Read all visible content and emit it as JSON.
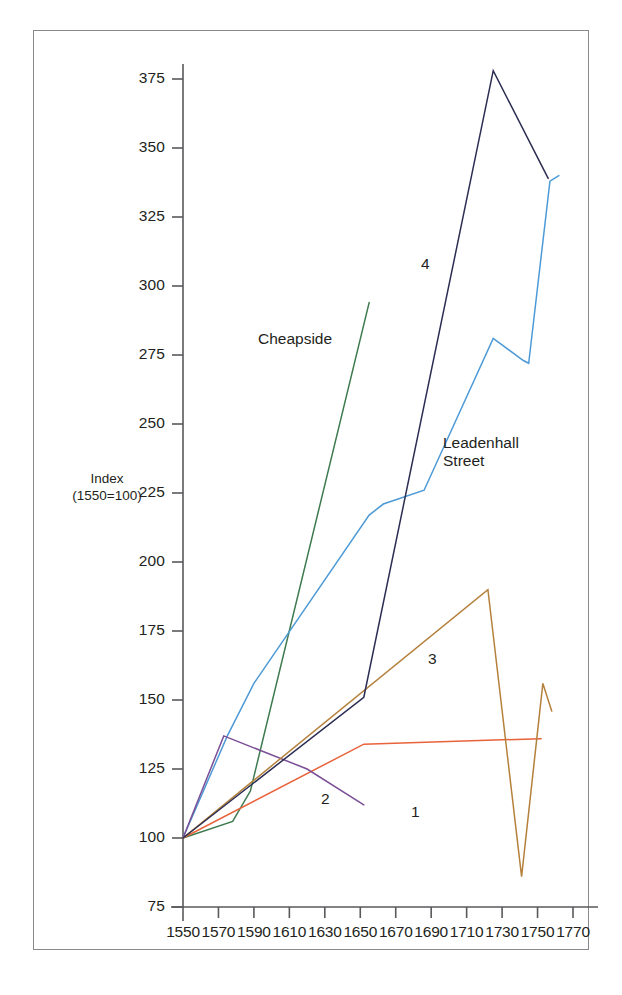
{
  "figure": {
    "axis_title_line1": "Index",
    "axis_title_line2": "(1550=100)",
    "frame_color": "#8a8a8a",
    "axis_color": "#58595b",
    "background": "#ffffff"
  },
  "chart_data": {
    "type": "line",
    "title": "",
    "xlabel": "",
    "ylabel": "Index (1550=100)",
    "xlim": [
      1550,
      1770
    ],
    "ylim": [
      75,
      385
    ],
    "xticks": [
      1550,
      1570,
      1590,
      1610,
      1630,
      1650,
      1670,
      1690,
      1710,
      1730,
      1750,
      1770
    ],
    "yticks": [
      75,
      100,
      125,
      150,
      175,
      200,
      225,
      250,
      275,
      300,
      325,
      350,
      375
    ],
    "grid": false,
    "legend": "inline-labels",
    "series": [
      {
        "name": "Cheapside",
        "label": "Cheapside",
        "color": "#3d7a4e",
        "points": [
          [
            1550,
            100
          ],
          [
            1578,
            106
          ],
          [
            1588,
            117
          ],
          [
            1655,
            294
          ]
        ]
      },
      {
        "name": "Leadenhall Street",
        "label": "Leadenhall\nStreet",
        "color": "#4d9ad6",
        "points": [
          [
            1550,
            100
          ],
          [
            1575,
            137
          ],
          [
            1590,
            156
          ],
          [
            1655,
            217
          ],
          [
            1663,
            221
          ],
          [
            1686,
            226
          ],
          [
            1725,
            281
          ],
          [
            1742,
            273
          ],
          [
            1745,
            272
          ],
          [
            1757,
            338
          ],
          [
            1762,
            340
          ]
        ]
      },
      {
        "name": "1",
        "label": "1",
        "color": "#e8633a",
        "points": [
          [
            1550,
            100
          ],
          [
            1652,
            134
          ],
          [
            1752,
            136
          ]
        ]
      },
      {
        "name": "2",
        "label": "2",
        "color": "#7b4f96",
        "points": [
          [
            1550,
            100
          ],
          [
            1573,
            137
          ],
          [
            1620,
            125
          ],
          [
            1652,
            112
          ]
        ]
      },
      {
        "name": "3",
        "label": "3",
        "color": "#b5803c",
        "points": [
          [
            1550,
            100
          ],
          [
            1722,
            190
          ],
          [
            1741,
            86
          ],
          [
            1753,
            156
          ],
          [
            1758,
            146
          ]
        ]
      },
      {
        "name": "4",
        "label": "4",
        "color": "#2b2d52",
        "points": [
          [
            1550,
            100
          ],
          [
            1652,
            151
          ],
          [
            1725,
            378
          ],
          [
            1756,
            339
          ]
        ]
      }
    ]
  },
  "series_labels": [
    {
      "text": "Cheapside",
      "x": 258,
      "y": 330
    },
    {
      "text": "Leadenhall",
      "x": 443,
      "y": 434
    },
    {
      "text": "Street",
      "x": 443,
      "y": 452
    },
    {
      "text": "4",
      "x": 421,
      "y": 255
    },
    {
      "text": "3",
      "x": 428,
      "y": 650
    },
    {
      "text": "1",
      "x": 411,
      "y": 803
    },
    {
      "text": "2",
      "x": 321,
      "y": 790
    }
  ]
}
